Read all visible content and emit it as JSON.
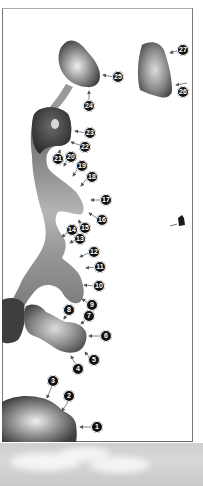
{
  "figure": {
    "type": "numbered-landmass-diagram",
    "callouts": [
      {
        "n": "1",
        "x": 97,
        "y": 137
      },
      {
        "n": "2",
        "x": 69,
        "y": 106
      },
      {
        "n": "3",
        "x": 53,
        "y": 91
      },
      {
        "n": "4",
        "x": 78,
        "y": 79
      },
      {
        "n": "5",
        "x": 94,
        "y": 70
      },
      {
        "n": "6",
        "x": 106,
        "y": 46
      },
      {
        "n": "7",
        "x": 89,
        "y": 26
      },
      {
        "n": "8",
        "x": 69,
        "y": 20
      },
      {
        "n": "9",
        "x": 92,
        "y": 15
      },
      {
        "n": "10",
        "x": 99,
        "y": 146
      },
      {
        "n": "11",
        "x": 100,
        "y": 127
      },
      {
        "n": "12",
        "x": 94,
        "y": 112
      },
      {
        "n": "13",
        "x": 80,
        "y": 99
      },
      {
        "n": "14",
        "x": 72,
        "y": 90
      },
      {
        "n": "15",
        "x": 85,
        "y": 88
      },
      {
        "n": "16",
        "x": 102,
        "y": 80
      },
      {
        "n": "17",
        "x": 106,
        "y": 60
      },
      {
        "n": "18",
        "x": 92,
        "y": 37
      },
      {
        "n": "19",
        "x": 82,
        "y": 26
      },
      {
        "n": "20",
        "x": 71,
        "y": 17
      },
      {
        "n": "21",
        "x": 58,
        "y": 19
      },
      {
        "n": "22",
        "x": 85,
        "y": 147
      },
      {
        "n": "23",
        "x": 90,
        "y": 133
      },
      {
        "n": "24",
        "x": 89,
        "y": 106
      },
      {
        "n": "25",
        "x": 118,
        "y": 77
      },
      {
        "n": "26",
        "x": 183,
        "y": 92
      },
      {
        "n": "27",
        "x": 183,
        "y": 50
      }
    ]
  },
  "labels": {
    "c1": "1",
    "c2": "2",
    "c3": "3",
    "c4": "4",
    "c5": "5",
    "c6": "6",
    "c7": "7",
    "c8": "8",
    "c9": "9",
    "c10": "10",
    "c11": "11",
    "c12": "12",
    "c13": "13",
    "c14": "14",
    "c15": "15",
    "c16": "16",
    "c17": "17",
    "c18": "18",
    "c19": "19",
    "c20": "20",
    "c21": "21",
    "c22": "22",
    "c23": "23",
    "c24": "24",
    "c25": "25",
    "c26": "26",
    "c27": "27"
  },
  "colors": {
    "landmass_dark": "#3a3a3a",
    "landmass_mid": "#8a8a8a",
    "landmass_light": "#e6e6e6",
    "badge": "#111111",
    "border": "#777777",
    "background": "#ffffff"
  }
}
